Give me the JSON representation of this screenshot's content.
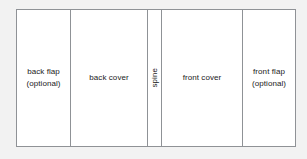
{
  "diagram": {
    "background_color": "#f2f2f2",
    "panel_fill_color": "#ffffff",
    "border_color": "#8f9296",
    "text_color": "#1a1a1a",
    "panels": [
      {
        "id": "back-flap",
        "label": "back flap\n(optional)",
        "orientation": "horizontal",
        "optional": true
      },
      {
        "id": "back-cover",
        "label": "back cover",
        "orientation": "horizontal",
        "optional": false
      },
      {
        "id": "spine",
        "label": "spine",
        "orientation": "vertical-bottom-to-top",
        "optional": false
      },
      {
        "id": "front-cover",
        "label": "front cover",
        "orientation": "horizontal",
        "optional": false
      },
      {
        "id": "front-flap",
        "label": "front flap\n(optional)",
        "orientation": "horizontal",
        "optional": true
      }
    ]
  }
}
